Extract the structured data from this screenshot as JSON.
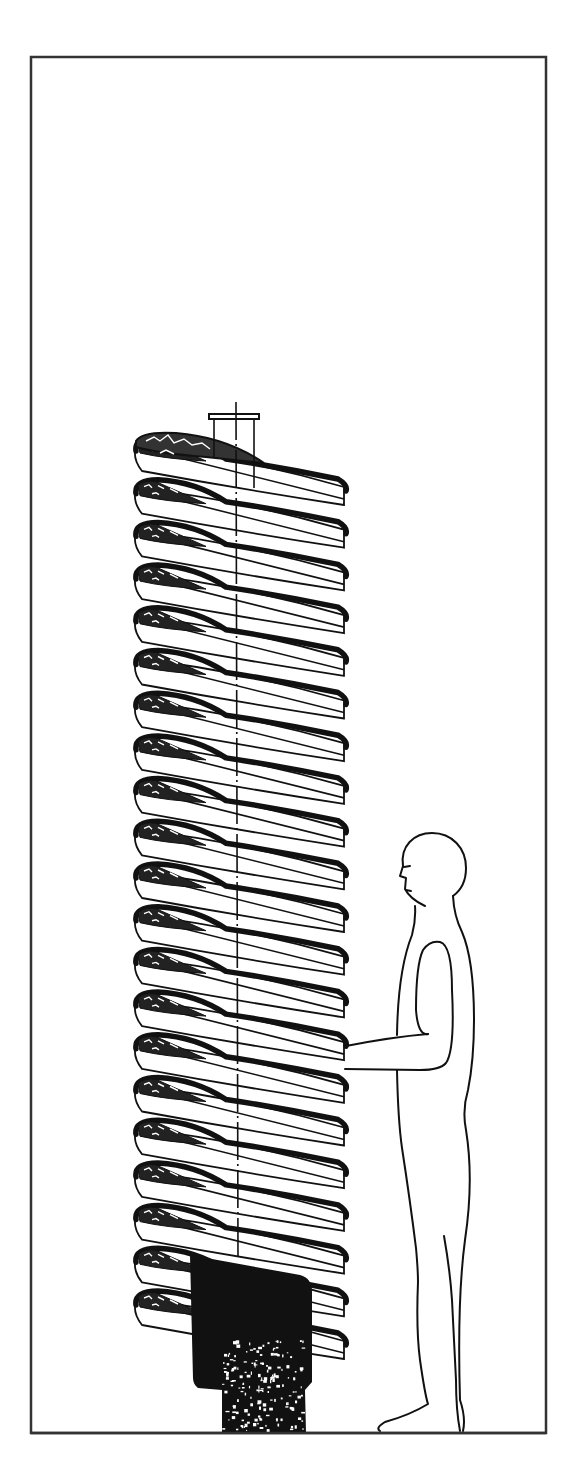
{
  "figure": {
    "type": "technical-line-illustration",
    "caption": "",
    "frame": {
      "x": 31,
      "y": 57,
      "width": 515,
      "height": 1376,
      "stroke": "#333333"
    },
    "colors": {
      "ink": "#111111",
      "paper": "#ffffff",
      "frame": "#333333"
    },
    "spiral": {
      "axis_x": 236,
      "left_x": 136,
      "right_x": 344,
      "top_y": 445,
      "pitch": 42.7,
      "turn_count": 21,
      "rim_drop_right": 64
    },
    "feed_pipe": {
      "x": 212,
      "width": 46,
      "top_y": 414,
      "bottom_y": 462,
      "cap_height": 5
    },
    "base": {
      "block": {
        "x": 190,
        "y": 1255,
        "width": 122,
        "height": 140
      },
      "pedestal": {
        "x": 220,
        "y": 1390,
        "width": 86,
        "height": 43
      }
    },
    "human_figure": {
      "label": "",
      "head_center": [
        434,
        866
      ],
      "feet_y": 1431
    }
  }
}
